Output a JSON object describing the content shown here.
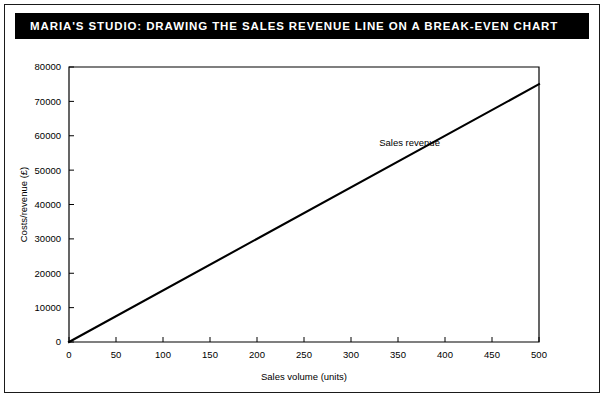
{
  "figure": {
    "title": "MARIA'S STUDIO: DRAWING THE SALES REVENUE LINE ON A BREAK-EVEN CHART",
    "background_color": "#ffffff",
    "title_bar_color": "#000000",
    "title_text_color": "#ffffff",
    "border_color": "#1a1a1a"
  },
  "chart_data": {
    "type": "line",
    "title": "",
    "xlabel": "Sales volume (units)",
    "ylabel": "Costs/revenue (£)",
    "xlim": [
      0,
      500
    ],
    "ylim": [
      0,
      80000
    ],
    "xticks": [
      0,
      50,
      100,
      150,
      200,
      250,
      300,
      350,
      400,
      450,
      500
    ],
    "xtick_labels": [
      "0",
      "50",
      "100",
      "150",
      "200",
      "250",
      "300",
      "350",
      "400",
      "450",
      "500"
    ],
    "yticks": [
      0,
      10000,
      20000,
      30000,
      40000,
      50000,
      60000,
      70000,
      80000
    ],
    "ytick_labels": [
      "0",
      "10000",
      "20000",
      "30000",
      "40000",
      "50000",
      "60000",
      "70000",
      "80000"
    ],
    "grid": false,
    "legend": "none",
    "tick_direction": "in",
    "series": [
      {
        "name": "Sales revenue",
        "color": "#000000",
        "line_width": 2,
        "slope_per_unit": 150,
        "x": [
          0,
          500
        ],
        "values": [
          0,
          75000
        ],
        "annotation": {
          "text": "Sales revenue",
          "x": 330,
          "y": 57000
        }
      }
    ]
  }
}
